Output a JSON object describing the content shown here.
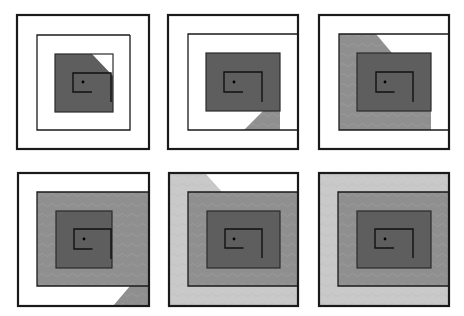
{
  "figure": {
    "layout": {
      "rows": 2,
      "cols": 3
    },
    "colors": {
      "background": "#ffffff",
      "stroke": "#1a1a1a",
      "dark_fill": "#5e5e5e",
      "mid_fill": "#8f8f8f",
      "light_fill": "#c9c9c9",
      "contour": "#a8a8a8"
    },
    "panels": [
      {
        "id": 1,
        "outer": [
          17,
          15,
          149,
          149
        ],
        "ring2": [
          37,
          35,
          130,
          130
        ],
        "ring3": [
          55,
          54,
          113,
          112
        ],
        "core": [
          73,
          73,
          111,
          92
        ],
        "dot": [
          83,
          82
        ],
        "fills": [
          {
            "shape": "poly",
            "level": "dark",
            "points": [
              [
                55,
                54
              ],
              [
                92,
                54
              ],
              [
                113,
                76
              ],
              [
                113,
                112
              ],
              [
                55,
                112
              ]
            ]
          }
        ]
      },
      {
        "id": 2,
        "outer": [
          168,
          15,
          298,
          149
        ],
        "ring2": [
          188,
          34,
          298,
          130
        ],
        "ring3": [
          206,
          53,
          280,
          111
        ],
        "core": [
          224,
          72,
          262,
          92
        ],
        "dot": [
          234,
          82
        ],
        "fills": [
          {
            "shape": "poly",
            "level": "dark",
            "points": [
              [
                206,
                53
              ],
              [
                280,
                53
              ],
              [
                280,
                111
              ],
              [
                206,
                111
              ]
            ]
          },
          {
            "shape": "poly",
            "level": "mid",
            "points": [
              [
                280,
                53
              ],
              [
                280,
                130
              ],
              [
                244,
                130
              ],
              [
                263,
                111
              ],
              [
                280,
                111
              ]
            ]
          }
        ]
      },
      {
        "id": 3,
        "outer": [
          319,
          15,
          449,
          149
        ],
        "ring2": [
          339,
          34,
          449,
          130
        ],
        "ring3": [
          357,
          53,
          431,
          111
        ],
        "core": [
          376,
          72,
          413,
          92
        ],
        "dot": [
          385,
          82
        ],
        "fills": [
          {
            "shape": "poly",
            "level": "mid",
            "points": [
              [
                339,
                34
              ],
              [
                376,
                34
              ],
              [
                392,
                53
              ],
              [
                431,
                53
              ],
              [
                431,
                130
              ],
              [
                339,
                130
              ]
            ]
          },
          {
            "shape": "poly",
            "level": "dark",
            "points": [
              [
                357,
                53
              ],
              [
                431,
                53
              ],
              [
                431,
                111
              ],
              [
                357,
                111
              ]
            ]
          }
        ]
      },
      {
        "id": 4,
        "outer": [
          18,
          173,
          149,
          306
        ],
        "ring2": [
          37,
          192,
          149,
          286
        ],
        "ring3": [
          56,
          211,
          112,
          268
        ],
        "core": [
          74,
          229,
          111,
          249
        ],
        "dot": [
          84,
          239
        ],
        "fills": [
          {
            "shape": "poly",
            "level": "mid",
            "points": [
              [
                37,
                192
              ],
              [
                149,
                192
              ],
              [
                149,
                306
              ],
              [
                113,
                306
              ],
              [
                130,
                286
              ],
              [
                37,
                286
              ]
            ]
          },
          {
            "shape": "poly",
            "level": "dark",
            "points": [
              [
                56,
                211
              ],
              [
                112,
                211
              ],
              [
                112,
                268
              ],
              [
                56,
                268
              ]
            ]
          }
        ]
      },
      {
        "id": 5,
        "outer": [
          169,
          173,
          298,
          306
        ],
        "ring2": [
          188,
          192,
          298,
          286
        ],
        "ring3": [
          207,
          211,
          280,
          268
        ],
        "core": [
          225,
          229,
          262,
          248
        ],
        "dot": [
          234,
          239
        ],
        "fills": [
          {
            "shape": "poly",
            "level": "light",
            "points": [
              [
                169,
                173
              ],
              [
                205,
                173
              ],
              [
                222,
                192
              ],
              [
                298,
                192
              ],
              [
                298,
                306
              ],
              [
                169,
                306
              ]
            ]
          },
          {
            "shape": "poly",
            "level": "mid",
            "points": [
              [
                188,
                192
              ],
              [
                298,
                192
              ],
              [
                298,
                286
              ],
              [
                188,
                286
              ]
            ]
          },
          {
            "shape": "poly",
            "level": "dark",
            "points": [
              [
                207,
                211
              ],
              [
                280,
                211
              ],
              [
                280,
                268
              ],
              [
                207,
                268
              ]
            ]
          }
        ]
      },
      {
        "id": 6,
        "outer": [
          319,
          173,
          449,
          306
        ],
        "ring2": [
          338,
          192,
          449,
          286
        ],
        "ring3": [
          357,
          211,
          431,
          268
        ],
        "core": [
          375,
          229,
          413,
          248
        ],
        "dot": [
          385,
          239
        ],
        "fills": [
          {
            "shape": "poly",
            "level": "light",
            "points": [
              [
                319,
                173
              ],
              [
                449,
                173
              ],
              [
                449,
                306
              ],
              [
                319,
                306
              ]
            ]
          },
          {
            "shape": "poly",
            "level": "mid",
            "points": [
              [
                338,
                192
              ],
              [
                449,
                192
              ],
              [
                449,
                286
              ],
              [
                338,
                286
              ]
            ]
          },
          {
            "shape": "poly",
            "level": "dark",
            "points": [
              [
                357,
                211
              ],
              [
                431,
                211
              ],
              [
                431,
                268
              ],
              [
                357,
                268
              ]
            ]
          }
        ]
      }
    ]
  }
}
